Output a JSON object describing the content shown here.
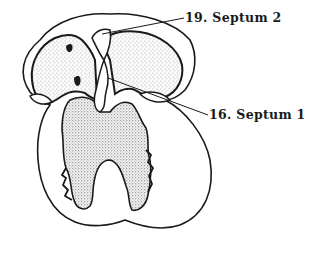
{
  "figure": {
    "labels": [
      {
        "number": "19.",
        "text": "Septum 2",
        "full": "19. Septum 2"
      },
      {
        "number": "16.",
        "text": "Septum 1",
        "full": "16. Septum 1"
      }
    ]
  },
  "colors": {
    "ink": "#1a1a1a",
    "background": "#ffffff",
    "stipple": "#555555"
  }
}
